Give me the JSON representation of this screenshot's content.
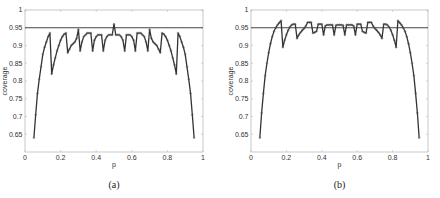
{
  "chart_data": [
    {
      "type": "line",
      "caption": "(a)",
      "xlabel": "p",
      "ylabel": "coverage",
      "xlim": [
        0,
        1
      ],
      "ylim": [
        0.6,
        1
      ],
      "xticks": [
        "0",
        "0.2",
        "0.4",
        "0.6",
        "0.8",
        "1"
      ],
      "yticks": [
        "0.65",
        "0.7",
        "0.75",
        "0.8",
        "0.85",
        "0.9",
        "0.95",
        "1"
      ],
      "reference_line": 0.95,
      "grid": false,
      "x": [
        0.05,
        0.06,
        0.07,
        0.08,
        0.09,
        0.1,
        0.11,
        0.12,
        0.13,
        0.14,
        0.15,
        0.16,
        0.17,
        0.18,
        0.19,
        0.2,
        0.21,
        0.22,
        0.23,
        0.24,
        0.25,
        0.26,
        0.27,
        0.28,
        0.29,
        0.3,
        0.31,
        0.32,
        0.33,
        0.34,
        0.35,
        0.36,
        0.37,
        0.38,
        0.39,
        0.4,
        0.41,
        0.42,
        0.43,
        0.44,
        0.45,
        0.46,
        0.47,
        0.48,
        0.49,
        0.5,
        0.51,
        0.52,
        0.53,
        0.54,
        0.55,
        0.56,
        0.57,
        0.58,
        0.59,
        0.6,
        0.61,
        0.62,
        0.63,
        0.64,
        0.65,
        0.66,
        0.67,
        0.68,
        0.69,
        0.7,
        0.71,
        0.72,
        0.73,
        0.74,
        0.75,
        0.76,
        0.77,
        0.78,
        0.79,
        0.8,
        0.81,
        0.82,
        0.83,
        0.84,
        0.85,
        0.86,
        0.87,
        0.88,
        0.89,
        0.9,
        0.91,
        0.92,
        0.93,
        0.94,
        0.95
      ],
      "values": [
        0.64,
        0.705,
        0.765,
        0.805,
        0.84,
        0.875,
        0.895,
        0.91,
        0.925,
        0.935,
        0.82,
        0.845,
        0.865,
        0.885,
        0.9,
        0.915,
        0.925,
        0.932,
        0.935,
        0.88,
        0.89,
        0.9,
        0.905,
        0.91,
        0.92,
        0.945,
        0.885,
        0.91,
        0.925,
        0.93,
        0.935,
        0.935,
        0.935,
        0.885,
        0.915,
        0.925,
        0.93,
        0.93,
        0.93,
        0.885,
        0.915,
        0.925,
        0.93,
        0.93,
        0.93,
        0.96,
        0.93,
        0.93,
        0.93,
        0.925,
        0.915,
        0.885,
        0.93,
        0.93,
        0.93,
        0.925,
        0.915,
        0.885,
        0.935,
        0.935,
        0.935,
        0.93,
        0.925,
        0.91,
        0.885,
        0.945,
        0.92,
        0.91,
        0.905,
        0.9,
        0.89,
        0.88,
        0.935,
        0.932,
        0.925,
        0.915,
        0.9,
        0.885,
        0.865,
        0.845,
        0.82,
        0.935,
        0.925,
        0.91,
        0.895,
        0.875,
        0.84,
        0.805,
        0.765,
        0.705,
        0.64
      ]
    },
    {
      "type": "line",
      "caption": "(b)",
      "xlabel": "p",
      "ylabel": "coverage",
      "xlim": [
        0,
        1
      ],
      "ylim": [
        0.6,
        1
      ],
      "xticks": [
        "0",
        "0.2",
        "0.4",
        "0.6",
        "0.8",
        "1"
      ],
      "yticks": [
        "0.65",
        "0.7",
        "0.75",
        "0.8",
        "0.85",
        "0.9",
        "0.95",
        "1"
      ],
      "reference_line": 0.95,
      "grid": false,
      "x": [
        0.05,
        0.06,
        0.07,
        0.08,
        0.09,
        0.1,
        0.11,
        0.12,
        0.13,
        0.14,
        0.15,
        0.16,
        0.17,
        0.18,
        0.19,
        0.2,
        0.21,
        0.22,
        0.23,
        0.24,
        0.25,
        0.26,
        0.27,
        0.28,
        0.29,
        0.3,
        0.31,
        0.32,
        0.33,
        0.34,
        0.35,
        0.36,
        0.37,
        0.38,
        0.39,
        0.4,
        0.41,
        0.42,
        0.43,
        0.44,
        0.45,
        0.46,
        0.47,
        0.48,
        0.49,
        0.5,
        0.51,
        0.52,
        0.53,
        0.54,
        0.55,
        0.56,
        0.57,
        0.58,
        0.59,
        0.6,
        0.61,
        0.62,
        0.63,
        0.64,
        0.65,
        0.66,
        0.67,
        0.68,
        0.69,
        0.7,
        0.71,
        0.72,
        0.73,
        0.74,
        0.75,
        0.76,
        0.77,
        0.78,
        0.79,
        0.8,
        0.81,
        0.82,
        0.83,
        0.84,
        0.85,
        0.86,
        0.87,
        0.88,
        0.89,
        0.9,
        0.91,
        0.92,
        0.93,
        0.94,
        0.95
      ],
      "values": [
        0.64,
        0.71,
        0.765,
        0.815,
        0.85,
        0.88,
        0.905,
        0.925,
        0.94,
        0.95,
        0.958,
        0.964,
        0.97,
        0.895,
        0.915,
        0.93,
        0.943,
        0.952,
        0.958,
        0.96,
        0.96,
        0.92,
        0.93,
        0.937,
        0.943,
        0.948,
        0.955,
        0.965,
        0.965,
        0.965,
        0.935,
        0.937,
        0.94,
        0.96,
        0.96,
        0.96,
        0.93,
        0.955,
        0.958,
        0.958,
        0.958,
        0.958,
        0.93,
        0.957,
        0.958,
        0.958,
        0.958,
        0.957,
        0.93,
        0.958,
        0.958,
        0.958,
        0.958,
        0.955,
        0.93,
        0.96,
        0.96,
        0.96,
        0.94,
        0.937,
        0.935,
        0.965,
        0.965,
        0.965,
        0.955,
        0.948,
        0.943,
        0.937,
        0.93,
        0.92,
        0.96,
        0.96,
        0.958,
        0.952,
        0.943,
        0.93,
        0.915,
        0.895,
        0.97,
        0.964,
        0.958,
        0.95,
        0.94,
        0.925,
        0.905,
        0.88,
        0.85,
        0.815,
        0.765,
        0.71,
        0.64
      ]
    }
  ],
  "layout": {
    "panels": [
      {
        "left": 25,
        "right": 203,
        "top": 10,
        "bottom": 152
      },
      {
        "left": 251,
        "right": 428,
        "top": 10,
        "bottom": 152
      }
    ],
    "colors": {
      "line": "#333333",
      "marker": "#555555",
      "reference": "#444444",
      "axes": "#bbbbbb"
    }
  }
}
